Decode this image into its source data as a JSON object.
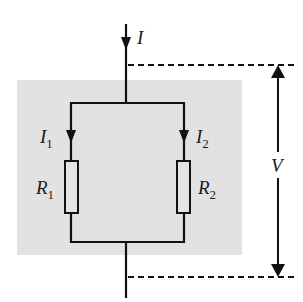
{
  "diagram": {
    "colors": {
      "wire": "#111111",
      "shading": "#e2e2e2",
      "resistor_fill": "#e4e4e4",
      "label": "#1a1a1a"
    },
    "labels": {
      "total_current": {
        "symbol": "I",
        "subscript": ""
      },
      "branch1_current": {
        "symbol": "I",
        "subscript": "1"
      },
      "branch2_current": {
        "symbol": "I",
        "subscript": "2"
      },
      "resistor1": {
        "symbol": "R",
        "subscript": "1"
      },
      "resistor2": {
        "symbol": "R",
        "subscript": "2"
      },
      "voltage": {
        "symbol": "V",
        "subscript": ""
      }
    },
    "components": [
      {
        "id": "R1",
        "type": "resistor",
        "branch": 1
      },
      {
        "id": "R2",
        "type": "resistor",
        "branch": 2
      }
    ],
    "connection": "parallel",
    "voltage_indicator": "double-headed arrow between dashed reference lines"
  }
}
